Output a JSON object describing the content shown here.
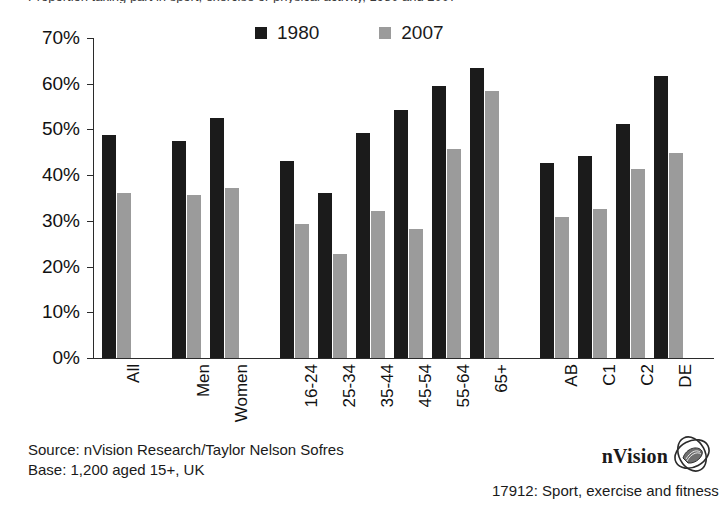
{
  "title_sliver": "Proportion taking part in sport, exercise or physical activity, 1980 and 2007",
  "legend": {
    "series": [
      {
        "name": "1980",
        "color": "#1b1b1b",
        "swatch_icon": "legend-swatch-square"
      },
      {
        "name": "2007",
        "color": "#9b9b9b",
        "swatch_icon": "legend-swatch-square"
      }
    ]
  },
  "axis": {
    "y_ticks": [
      "0%",
      "10%",
      "20%",
      "30%",
      "40%",
      "50%",
      "60%",
      "70%"
    ]
  },
  "footer": {
    "source": "Source: nVision Research/Taylor Nelson Sofres",
    "base": "Base: 1,200 aged 15+, UK"
  },
  "brand": {
    "name": "nVision",
    "logo_icon": "nvision-ellipse-logo",
    "caption": "17912: Sport, exercise and fitness"
  },
  "chart_data": {
    "type": "bar",
    "title": "Proportion taking part in sport, exercise or physical activity, 1980 and 2007",
    "xlabel": "",
    "ylabel": "",
    "ylim": [
      0,
      70
    ],
    "y_tick_step": 10,
    "y_unit": "%",
    "grid": false,
    "legend_position": "top-center",
    "categories": [
      "All",
      "Men",
      "Women",
      "16-24",
      "25-34",
      "35-44",
      "45-54",
      "55-64",
      "65+",
      "AB",
      "C1",
      "C2",
      "DE"
    ],
    "group_breaks_after": [
      "All",
      "Women",
      "65+"
    ],
    "series": [
      {
        "name": "1980",
        "color": "#1b1b1b",
        "values": [
          48.8,
          47.4,
          52.5,
          43.2,
          36.2,
          49.3,
          54.3,
          59.4,
          63.4,
          42.7,
          44.3,
          51.1,
          61.8
        ]
      },
      {
        "name": "2007",
        "color": "#9b9b9b",
        "values": [
          36.1,
          35.7,
          37.1,
          29.3,
          22.7,
          32.1,
          28.2,
          45.8,
          58.5,
          30.9,
          32.5,
          41.4,
          44.8
        ]
      }
    ]
  }
}
